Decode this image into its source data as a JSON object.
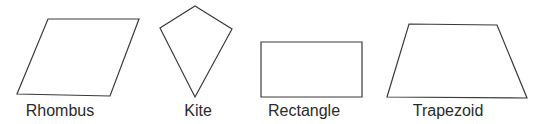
{
  "figure": {
    "stroke_color": "#3a3a3a",
    "background": "#ffffff",
    "shapes": [
      {
        "name": "Rhombus",
        "points": "48,19 139,19 110,96 17,94",
        "label_x": 60
      },
      {
        "name": "Kite",
        "points": "195,6 232,29 195,97 160,28",
        "label_x": 198
      },
      {
        "name": "Rectangle",
        "points": "261,42 362,42 362,97 261,97",
        "label_x": 304
      },
      {
        "name": "Trapezoid",
        "points": "409,24 497,25 527,98 387,97",
        "label_x": 448
      }
    ]
  }
}
